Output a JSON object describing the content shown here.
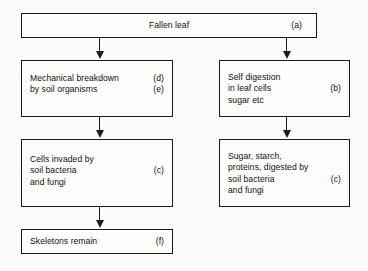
{
  "diagram": {
    "colors": {
      "background": "#fbfbf9",
      "box_fill": "#fdfdfb",
      "stroke": "#1b1b1b",
      "text": "#111111"
    },
    "nodes": [
      {
        "id": "fallen-leaf",
        "lines": [
          "Fallen leaf"
        ],
        "tag": "(a)",
        "tag_line_index": 0
      },
      {
        "id": "mechanical-breakdown",
        "lines": [
          "Mechanical breakdown",
          "by soil organisms"
        ],
        "tags": [
          "(d)",
          "(e)"
        ]
      },
      {
        "id": "self-digestion",
        "lines": [
          "Self digestion",
          "in leaf cells",
          "sugar etc"
        ],
        "tag": "(b)",
        "tag_line_index": 1
      },
      {
        "id": "cells-invaded",
        "lines": [
          "Cells invaded by",
          "soil bacteria",
          "and fungi"
        ],
        "tag": "(c)",
        "tag_line_index": 1
      },
      {
        "id": "sugar-starch",
        "lines": [
          "Sugar, starch,",
          "proteins, digested by",
          "soil bacteria",
          "and fungi"
        ],
        "tag": "(c)",
        "tag_line_index": 2
      },
      {
        "id": "skeletons-remain",
        "lines": [
          "Skeletons remain"
        ],
        "tag": "(f)",
        "tag_line_index": 0
      }
    ],
    "edges": [
      {
        "id": "leaf-to-mechanical",
        "from": "fallen-leaf",
        "to": "mechanical-breakdown"
      },
      {
        "id": "leaf-to-self-digestion",
        "from": "fallen-leaf",
        "to": "self-digestion"
      },
      {
        "id": "mechanical-to-cells",
        "from": "mechanical-breakdown",
        "to": "cells-invaded"
      },
      {
        "id": "self-digestion-to-sugar",
        "from": "self-digestion",
        "to": "sugar-starch"
      },
      {
        "id": "cells-to-skeletons",
        "from": "cells-invaded",
        "to": "skeletons-remain"
      }
    ]
  }
}
